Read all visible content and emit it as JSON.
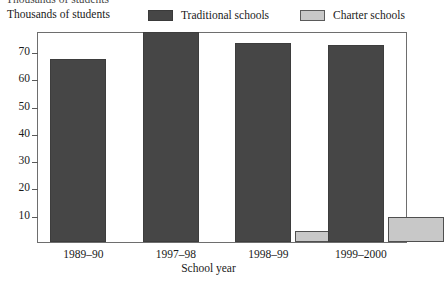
{
  "clipped_top_text": "Thousands of students",
  "y_axis_caption": "Thousands of students",
  "legend": {
    "traditional": {
      "label": "Traditional schools",
      "color": "#464646",
      "swatch": "dark-swatch-icon"
    },
    "charter": {
      "label": "Charter schools",
      "color": "#c8c8c8",
      "swatch": "light-swatch-icon"
    }
  },
  "x_axis_title": "School year",
  "chart_data": {
    "type": "bar",
    "title": "",
    "xlabel": "School year",
    "ylabel": "Thousands of students",
    "categories": [
      "1989–90",
      "1997–98",
      "1998–99",
      "1999–2000"
    ],
    "series": [
      {
        "name": "Traditional schools",
        "color": "#464646",
        "values": [
          67,
          77,
          73,
          72
        ]
      },
      {
        "name": "Charter schools",
        "color": "#c8c8c8",
        "values": [
          null,
          null,
          4,
          9
        ]
      }
    ],
    "ylim": [
      0,
      77.3
    ],
    "yticks": [
      10,
      20,
      30,
      40,
      50,
      60,
      70
    ],
    "ytick_labels": [
      "10",
      "20",
      "30",
      "40",
      "50",
      "60",
      "70"
    ],
    "grid": false,
    "legend_position": "top"
  }
}
